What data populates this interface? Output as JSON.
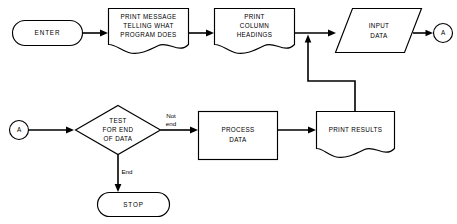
{
  "diagram": {
    "background_color": "#ffffff",
    "line_color": "#000000",
    "nodes": {
      "enter": {
        "label": "ENTER",
        "shape": "terminal"
      },
      "print_message": {
        "line1": "PRINT MESSAGE",
        "line2": "TELLING WHAT",
        "line3": "PROGRAM DOES",
        "shape": "document"
      },
      "print_headings": {
        "line1": "PRINT",
        "line2": "COLUMN",
        "line3": "HEADINGS",
        "shape": "document"
      },
      "input_data": {
        "line1": "INPUT",
        "line2": "DATA",
        "shape": "parallelogram"
      },
      "connector_a_top": {
        "label": "A",
        "shape": "connector"
      },
      "connector_a_bottom": {
        "label": "A",
        "shape": "connector"
      },
      "test_end": {
        "line1": "TEST",
        "line2": "FOR END",
        "line3": "OF DATA",
        "shape": "decision"
      },
      "process_data": {
        "line1": "PROCESS",
        "line2": "DATA",
        "shape": "process"
      },
      "print_results": {
        "label": "PRINT RESULTS",
        "shape": "document"
      },
      "stop": {
        "label": "STOP",
        "shape": "terminal"
      }
    },
    "edge_labels": {
      "not_end_line1": "Not",
      "not_end_line2": "end",
      "end": "End"
    }
  }
}
